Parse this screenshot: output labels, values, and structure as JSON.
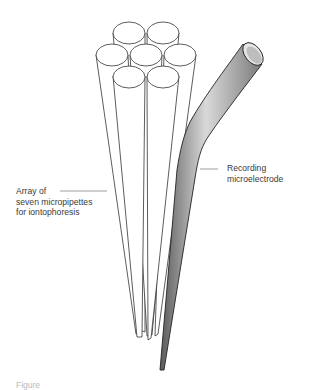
{
  "diagram": {
    "type": "illustration",
    "labels": {
      "array": [
        "Array of",
        "seven micropipettes",
        "for iontophoresis"
      ],
      "recording": [
        "Recording",
        "microelectrode"
      ]
    },
    "components": [
      {
        "id": "micropipette-array",
        "count": 7,
        "arrangement": "hexagonal bundle (1 center + 6 around)",
        "fill": "#ffffff",
        "stroke": "#333333"
      },
      {
        "id": "recording-microelectrode",
        "shape": "bent tapered tube",
        "fill_gradient": [
          "#5a5a5a",
          "#d8d8d8",
          "#7a7a7a"
        ],
        "stroke": "#222222"
      }
    ],
    "caption": "Figure"
  },
  "colors": {
    "background": "#ffffff",
    "line": "#333333",
    "label_text": "#3a3a3a",
    "leader_line": "#777777"
  }
}
